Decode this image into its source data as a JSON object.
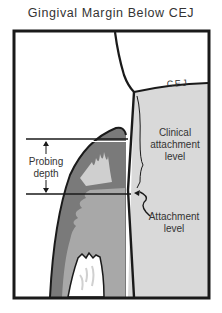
{
  "title": "Gingival Margin Below CEJ",
  "labels": {
    "cej": "CEJ",
    "clinical_attachment_line1": "Clinical",
    "clinical_attachment_line2": "attachment",
    "clinical_attachment_line3": "level",
    "probing_line1": "Probing",
    "probing_line2": "depth",
    "attachment_line1": "Attachment",
    "attachment_line2": "level"
  },
  "colors": {
    "frame": "#1a1a1a",
    "tooth_root": "#d9d9d9",
    "gingiva_outer": "#7a7a7a",
    "gingiva_inner": "#a8a8a8",
    "connective_light": "#c8c8c8",
    "bone": "#ffffff",
    "text": "#333333"
  }
}
